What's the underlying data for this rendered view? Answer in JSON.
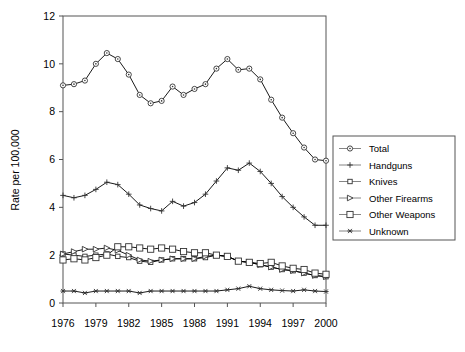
{
  "chart_data": {
    "type": "line",
    "title": "",
    "xlabel": "",
    "ylabel": "Rate per 100,000",
    "xlim": [
      1976,
      2000
    ],
    "ylim": [
      0,
      12
    ],
    "ytick_values": [
      0,
      2,
      4,
      6,
      8,
      10,
      12
    ],
    "ytick_labels": [
      "0",
      "2",
      "4",
      "6",
      "8",
      "10",
      "12"
    ],
    "xtick_values": [
      1976,
      1979,
      1982,
      1985,
      1988,
      1991,
      1994,
      1997,
      2000
    ],
    "xtick_labels": [
      "1976",
      "1979",
      "1982",
      "1985",
      "1988",
      "1991",
      "1994",
      "1997",
      "2000"
    ],
    "x": [
      1976,
      1977,
      1978,
      1979,
      1980,
      1981,
      1982,
      1983,
      1984,
      1985,
      1986,
      1987,
      1988,
      1989,
      1990,
      1991,
      1992,
      1993,
      1994,
      1995,
      1996,
      1997,
      1998,
      1999,
      2000
    ],
    "grid": false,
    "legend_position": "right",
    "series": [
      {
        "name": "Total",
        "marker": "circle",
        "color": "#000000",
        "values": [
          9.1,
          9.15,
          9.3,
          10.0,
          10.45,
          10.2,
          9.55,
          8.7,
          8.35,
          8.45,
          9.05,
          8.7,
          8.95,
          9.15,
          9.8,
          10.2,
          9.75,
          9.8,
          9.35,
          8.5,
          7.75,
          7.1,
          6.5,
          6.0,
          5.95
        ]
      },
      {
        "name": "Handguns",
        "marker": "plus",
        "color": "#000000",
        "values": [
          4.5,
          4.4,
          4.5,
          4.75,
          5.05,
          4.95,
          4.55,
          4.1,
          3.95,
          3.85,
          4.25,
          4.05,
          4.2,
          4.55,
          5.1,
          5.65,
          5.55,
          5.85,
          5.5,
          5.0,
          4.45,
          4.0,
          3.6,
          3.25,
          3.25
        ]
      },
      {
        "name": "Knives",
        "marker": "square-small",
        "color": "#000000",
        "values": [
          2.05,
          2.0,
          1.95,
          2.0,
          2.05,
          1.95,
          1.9,
          1.75,
          1.7,
          1.8,
          1.85,
          1.85,
          1.85,
          1.9,
          2.0,
          1.95,
          1.75,
          1.7,
          1.6,
          1.5,
          1.4,
          1.35,
          1.25,
          1.15,
          1.1
        ]
      },
      {
        "name": "Other Firearms",
        "marker": "triangle-right",
        "color": "#000000",
        "values": [
          2.05,
          2.15,
          2.25,
          2.25,
          2.3,
          2.2,
          2.0,
          1.8,
          1.75,
          1.8,
          1.85,
          1.85,
          1.85,
          1.95,
          2.0,
          1.95,
          1.75,
          1.7,
          1.6,
          1.5,
          1.4,
          1.35,
          1.25,
          1.15,
          1.1
        ]
      },
      {
        "name": "Other Weapons",
        "marker": "square-large",
        "color": "#000000",
        "values": [
          1.8,
          1.85,
          1.8,
          1.9,
          2.0,
          2.35,
          2.35,
          2.3,
          2.25,
          2.3,
          2.25,
          2.15,
          2.1,
          2.1,
          2.0,
          1.95,
          1.75,
          1.7,
          1.65,
          1.7,
          1.55,
          1.45,
          1.4,
          1.25,
          1.2
        ]
      },
      {
        "name": "Unknown",
        "marker": "asterisk",
        "color": "#000000",
        "values": [
          0.5,
          0.5,
          0.42,
          0.5,
          0.5,
          0.5,
          0.5,
          0.42,
          0.5,
          0.5,
          0.5,
          0.5,
          0.5,
          0.5,
          0.5,
          0.55,
          0.6,
          0.7,
          0.6,
          0.55,
          0.52,
          0.5,
          0.55,
          0.5,
          0.48
        ]
      }
    ]
  },
  "legend": {
    "entries": [
      {
        "label": "Total"
      },
      {
        "label": "Handguns"
      },
      {
        "label": "Knives"
      },
      {
        "label": "Other Firearms"
      },
      {
        "label": "Other Weapons"
      },
      {
        "label": "Unknown"
      }
    ]
  }
}
